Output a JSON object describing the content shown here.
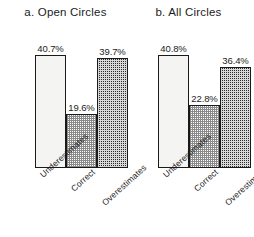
{
  "chart_data": [
    {
      "type": "bar",
      "title": "a. Open Circles",
      "categories": [
        "Underestimates",
        "Correct",
        "Overestimates"
      ],
      "values": [
        40.7,
        19.6,
        39.7
      ],
      "value_labels": [
        "40.7%",
        "19.6%",
        "39.7%"
      ],
      "xlabel": "",
      "ylabel": "",
      "ylim": [
        0,
        45
      ],
      "grid": false,
      "legend": "none",
      "bar_styles": [
        "open",
        "light-checker",
        "dark-checker"
      ]
    },
    {
      "type": "bar",
      "title": "b. All Circles",
      "categories": [
        "Underestimates",
        "Correct",
        "Overestimates"
      ],
      "values": [
        40.8,
        22.8,
        36.4
      ],
      "value_labels": [
        "40.8%",
        "22.8%",
        "36.4%"
      ],
      "xlabel": "",
      "ylabel": "",
      "ylim": [
        0,
        45
      ],
      "grid": false,
      "legend": "none",
      "bar_styles": [
        "open",
        "light-checker",
        "dark-checker"
      ]
    }
  ],
  "panels": {
    "a": {
      "title": "a. Open Circles",
      "bars": [
        {
          "label": "Underestimates",
          "value_label": "40.7%"
        },
        {
          "label": "Correct",
          "value_label": "19.6%"
        },
        {
          "label": "Overestimates",
          "value_label": "39.7%"
        }
      ]
    },
    "b": {
      "title": "b. All Circles",
      "bars": [
        {
          "label": "Underestimates",
          "value_label": "40.8%"
        },
        {
          "label": "Correct",
          "value_label": "22.8%"
        },
        {
          "label": "Overestimates",
          "value_label": "36.4%"
        }
      ]
    }
  }
}
